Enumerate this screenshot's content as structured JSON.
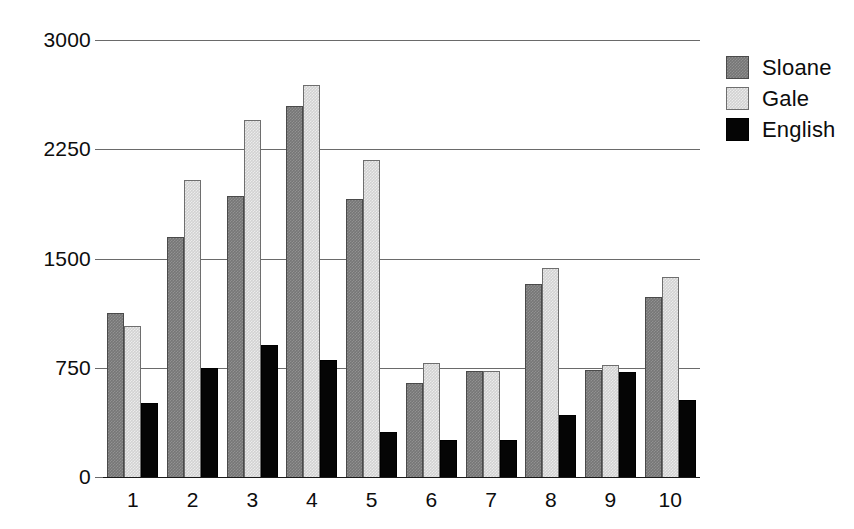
{
  "chart_data": {
    "type": "bar",
    "title": "",
    "xlabel": "",
    "ylabel": "",
    "categories": [
      "1",
      "2",
      "3",
      "4",
      "5",
      "6",
      "7",
      "8",
      "9",
      "10"
    ],
    "series": [
      {
        "name": "Sloane",
        "color": "#767676",
        "values": [
          1125,
          1650,
          1930,
          2550,
          1910,
          645,
          725,
          1325,
          735,
          1235
        ]
      },
      {
        "name": "Gale",
        "color": "#d2d2d2",
        "values": [
          1040,
          2040,
          2450,
          2690,
          2175,
          780,
          725,
          1435,
          770,
          1370
        ]
      },
      {
        "name": "English",
        "color": "#050505",
        "values": [
          510,
          745,
          905,
          800,
          310,
          255,
          255,
          425,
          720,
          530
        ]
      }
    ],
    "ylim": [
      0,
      3000
    ],
    "yticks": [
      0,
      750,
      1500,
      2250,
      3000
    ],
    "ytick_labels": [
      "0",
      "750",
      "1500",
      "2250",
      "3000"
    ],
    "grid": true,
    "legend_position": "right"
  },
  "legend": {
    "entries": [
      {
        "label": "Sloane"
      },
      {
        "label": "Gale"
      },
      {
        "label": "English"
      }
    ]
  },
  "axes": {
    "y_labels": [
      "3000",
      "2250",
      "1500",
      "750",
      "0"
    ],
    "x_labels": [
      "1",
      "2",
      "3",
      "4",
      "5",
      "6",
      "7",
      "8",
      "9",
      "10"
    ]
  }
}
